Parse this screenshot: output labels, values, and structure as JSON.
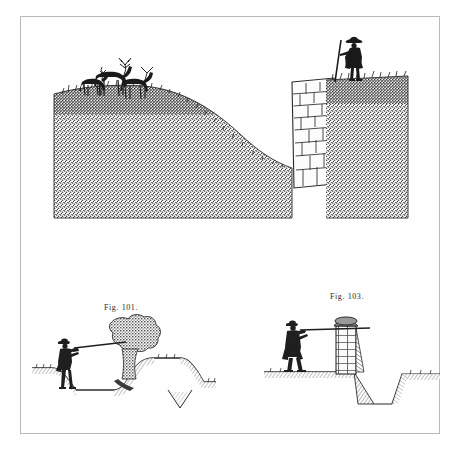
{
  "page": {
    "background_color": "#fefefe",
    "frame_color": "#b9b9b9",
    "ink_color": "#2b2b2b",
    "medium": "engraved plate on aged paper"
  },
  "plate": {
    "figures": [
      {
        "id": "top-illustration",
        "caption": "",
        "subject": "sunk fence (ha-ha) shown in perspective",
        "elements": [
          "three antlered deer standing on grass ridge at left",
          "stippled earthen bank sloping down to the right",
          "coursed stone retaining wall",
          "man in tricorn hat holding a long staff on the lawn at right"
        ]
      },
      {
        "id": "figure-101",
        "caption": "Fig. 101.",
        "subject": "section of a sunk fence with hedge",
        "elements": [
          "man shouldering a long gun aiming across the ditch",
          "bushy hedge growing on the far bank",
          "V-shaped ditch cut in turf"
        ]
      },
      {
        "id": "figure-103",
        "caption": "Fig. 103.",
        "subject": "section of a sunk fence with masonry wall",
        "elements": [
          "man shouldering a long gun aiming over the wall",
          "brick-coursed retaining wall with coped top",
          "hatched sloping bank and V-shaped ditch"
        ]
      }
    ]
  },
  "captions": {
    "fig_101": "Fig. 101.",
    "fig_103": "Fig. 103."
  }
}
